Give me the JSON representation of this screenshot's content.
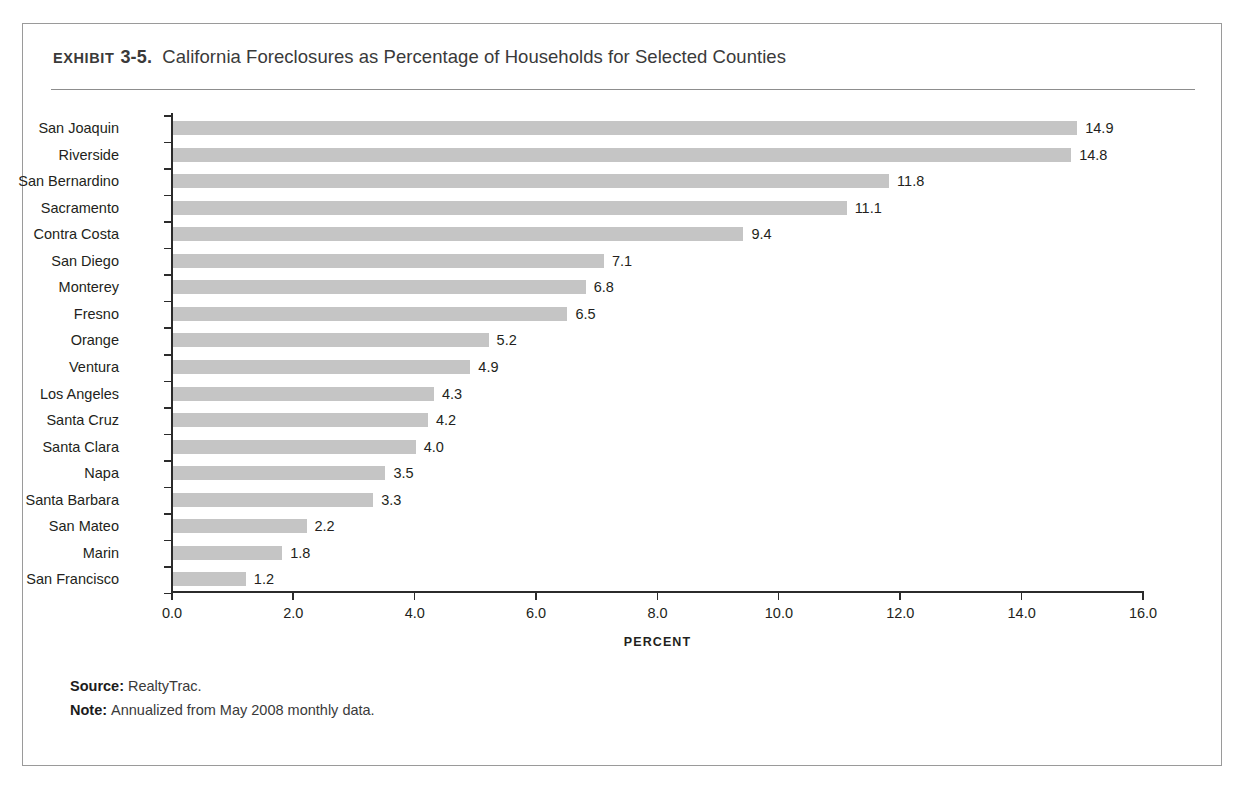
{
  "figure": {
    "exhibit_label": "EXHIBIT",
    "exhibit_number": "3-5.",
    "title": "California Foreclosures as Percentage of Households for Selected Counties"
  },
  "footnotes": {
    "source_key": "Source:",
    "source_value": "RealtyTrac.",
    "note_key": "Note:",
    "note_value": "Annualized from May 2008 monthly data."
  },
  "chart_data": {
    "type": "bar",
    "orientation": "horizontal",
    "title": "California Foreclosures as Percentage of Households for Selected Counties",
    "xlabel": "PERCENT",
    "ylabel": "",
    "xlim": [
      0.0,
      16.0
    ],
    "xticks": [
      0.0,
      2.0,
      4.0,
      6.0,
      8.0,
      10.0,
      12.0,
      14.0,
      16.0
    ],
    "xtick_labels": [
      "0.0",
      "2.0",
      "4.0",
      "6.0",
      "8.0",
      "10.0",
      "12.0",
      "14.0",
      "16.0"
    ],
    "grid": false,
    "legend": false,
    "bar_color": "#c5c5c5",
    "categories": [
      "San Joaquin",
      "Riverside",
      "San Bernardino",
      "Sacramento",
      "Contra Costa",
      "San Diego",
      "Monterey",
      "Fresno",
      "Orange",
      "Ventura",
      "Los Angeles",
      "Santa Cruz",
      "Santa Clara",
      "Napa",
      "Santa Barbara",
      "San Mateo",
      "Marin",
      "San Francisco"
    ],
    "values": [
      14.9,
      14.8,
      11.8,
      11.1,
      9.4,
      7.1,
      6.8,
      6.5,
      5.2,
      4.9,
      4.3,
      4.2,
      4.0,
      3.5,
      3.3,
      2.2,
      1.8,
      1.2
    ],
    "value_labels": [
      "14.9",
      "14.8",
      "11.8",
      "11.1",
      "9.4",
      "7.1",
      "6.8",
      "6.5",
      "5.2",
      "4.9",
      "4.3",
      "4.2",
      "4.0",
      "3.5",
      "3.3",
      "2.2",
      "1.8",
      "1.2"
    ]
  }
}
